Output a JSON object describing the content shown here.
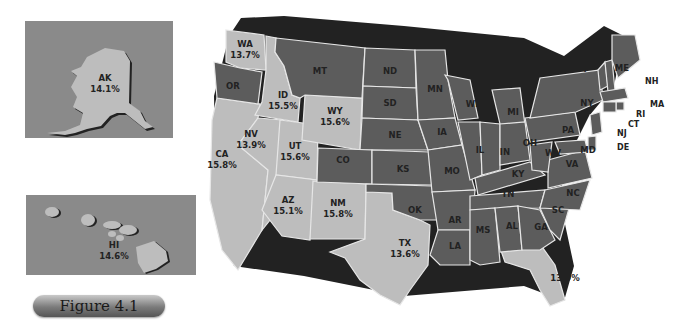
{
  "figure": {
    "label": "Figure 4.1"
  },
  "legend_colors": {
    "light_gray_states": "#bdbdbd",
    "dark_gray_states": "#5c5c5c",
    "shadow": "#222222",
    "inset_background": "#8a8a8a",
    "border": "#e6e6e6"
  },
  "insets": {
    "alaska": {
      "abbr": "AK",
      "value": "14.1%"
    },
    "hawaii": {
      "abbr": "HI",
      "value": "14.6%"
    }
  },
  "states_labeled": {
    "WA": {
      "abbr": "WA",
      "value": "13.7%"
    },
    "ID": {
      "abbr": "ID",
      "value": "15.5%"
    },
    "WY": {
      "abbr": "WY",
      "value": "15.6%"
    },
    "NV": {
      "abbr": "NV",
      "value": "13.9%"
    },
    "UT": {
      "abbr": "UT",
      "value": "15.6%"
    },
    "CA": {
      "abbr": "CA",
      "value": "15.8%"
    },
    "AZ": {
      "abbr": "AZ",
      "value": "15.1%"
    },
    "NM": {
      "abbr": "NM",
      "value": "15.8%"
    },
    "TX": {
      "abbr": "TX",
      "value": "13.6%"
    },
    "FL": {
      "abbr": "FL",
      "value": "13.9%"
    }
  },
  "states_unlabeled": [
    "OR",
    "MT",
    "ND",
    "SD",
    "MN",
    "WI",
    "MI",
    "NE",
    "IA",
    "IL",
    "IN",
    "OH",
    "CO",
    "KS",
    "MO",
    "KY",
    "WV",
    "VA",
    "PA",
    "NY",
    "VT",
    "NH",
    "ME",
    "MA",
    "RI",
    "CT",
    "NJ",
    "DE",
    "MD",
    "OK",
    "AR",
    "TN",
    "NC",
    "SC",
    "MS",
    "AL",
    "GA",
    "LA"
  ]
}
